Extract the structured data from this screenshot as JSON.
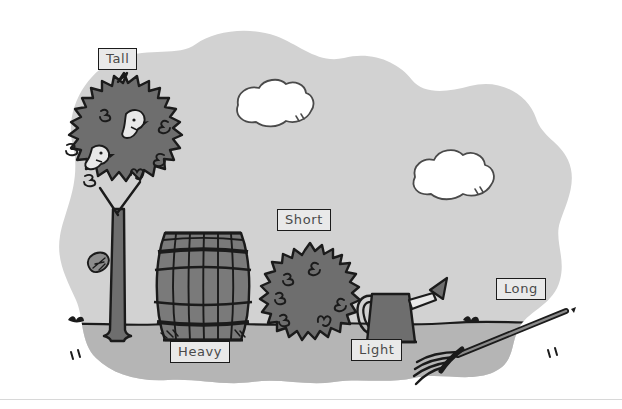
{
  "scene": {
    "title": "Garden scene with labelled objects",
    "description": "Cartoon outdoor scene: a tall tree with two birds, a heavy barrel, a short bush, a light watering can and a long rake, on a grey blob-shaped background with two clouds.",
    "background_color": "#ffffff",
    "sky_color": "#d2d2d2",
    "ground_color": "#b5b5b5",
    "object_fill_color": "#6e6e6e",
    "outline_color": "#1b1b1b",
    "cloud_color": "#ffffff",
    "label_fill_color": "#e9e9e9",
    "label_text_color": "#4a4a4a"
  },
  "labels": [
    {
      "id": "tall",
      "text": "Tall",
      "describes": "tree"
    },
    {
      "id": "short",
      "text": "Short",
      "describes": "bush"
    },
    {
      "id": "heavy",
      "text": "Heavy",
      "describes": "barrel"
    },
    {
      "id": "light",
      "text": "Light",
      "describes": "watering-can"
    },
    {
      "id": "long",
      "text": "Long",
      "describes": "rake"
    }
  ],
  "objects": [
    {
      "id": "tree",
      "name": "tree",
      "label": "Tall"
    },
    {
      "id": "barrel",
      "name": "barrel",
      "label": "Heavy"
    },
    {
      "id": "bush",
      "name": "bush",
      "label": "Short"
    },
    {
      "id": "watering-can",
      "name": "watering can",
      "label": "Light"
    },
    {
      "id": "rake",
      "name": "rake",
      "label": "Long"
    }
  ],
  "decorations": {
    "clouds": 2,
    "birds": 2,
    "falling_leaf": 1,
    "grass_tufts": 2,
    "ground_ticks": 2
  }
}
